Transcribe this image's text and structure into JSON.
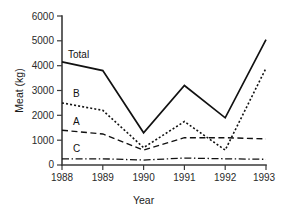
{
  "chart_data": {
    "type": "line",
    "title": "",
    "xlabel": "Year",
    "ylabel": "Meat (kg)",
    "categories": [
      "1988",
      "1989",
      "1990",
      "1991",
      "1992",
      "1993"
    ],
    "x": [
      1988,
      1989,
      1990,
      1991,
      1992,
      1993
    ],
    "xlim": [
      1988,
      1993
    ],
    "ylim": [
      0,
      6000
    ],
    "yticks": [
      "0",
      "1000",
      "2000",
      "3000",
      "4000",
      "5000",
      "6000"
    ],
    "ytick_values": [
      0,
      1000,
      2000,
      3000,
      4000,
      5000,
      6000
    ],
    "grid": false,
    "legend": "inline-labels",
    "series": [
      {
        "name": "Total",
        "label": "Total",
        "style": "solid",
        "values": [
          4150,
          3800,
          1300,
          3200,
          1900,
          5050
        ]
      },
      {
        "name": "B",
        "label": "B",
        "style": "dotted",
        "values": [
          2500,
          2200,
          700,
          1750,
          600,
          3900
        ]
      },
      {
        "name": "A",
        "label": "A",
        "style": "dashed",
        "values": [
          1400,
          1250,
          600,
          1100,
          1100,
          1050
        ]
      },
      {
        "name": "C",
        "label": "C",
        "style": "dash-dot",
        "values": [
          250,
          250,
          200,
          280,
          250,
          230
        ]
      }
    ]
  },
  "colors": {
    "background": "#ffffff",
    "ink": "#111111",
    "axis": "#3a3a3a"
  }
}
